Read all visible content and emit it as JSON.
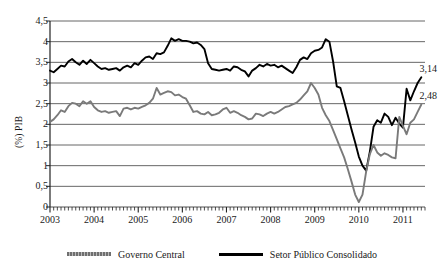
{
  "chart_data": {
    "type": "line",
    "title": "",
    "xlabel": "",
    "ylabel": "(%) PIB",
    "ylim": [
      0,
      4.5
    ],
    "xlim": [
      2003.0,
      2011.5
    ],
    "ytick_labels": [
      "4,5",
      "4",
      "3,5",
      "3",
      "2,5",
      "2",
      "1,5",
      "1",
      "0,5",
      "0"
    ],
    "ytick_values": [
      4.5,
      4,
      3.5,
      3,
      2.5,
      2,
      1.5,
      1,
      0.5,
      0
    ],
    "xtick_labels": [
      "2003",
      "2004",
      "2005",
      "2006",
      "2007",
      "2008",
      "2009",
      "2010",
      "2011"
    ],
    "xtick_values": [
      2003,
      2004,
      2005,
      2006,
      2007,
      2008,
      2009,
      2010,
      2011
    ],
    "grid": true,
    "minor_ticks": "monthly",
    "legend_position": "bottom",
    "colors": {
      "governo_central": "#7a7a7a",
      "setor_publico": "#000000",
      "grid": "#555555",
      "axis": "#222222"
    },
    "annotations": [
      {
        "text": "3,14",
        "series": "Setor Público Consolidado",
        "x": 2011.42,
        "y": 3.14
      },
      {
        "text": "2,48",
        "series": "Governo Central",
        "x": 2011.42,
        "y": 2.48
      }
    ],
    "series": [
      {
        "name": "Setor Público Consolidado",
        "color": "#000000",
        "x": [
          2003.0,
          2003.083,
          2003.167,
          2003.25,
          2003.333,
          2003.417,
          2003.5,
          2003.583,
          2003.667,
          2003.75,
          2003.833,
          2003.917,
          2004.0,
          2004.083,
          2004.167,
          2004.25,
          2004.333,
          2004.417,
          2004.5,
          2004.583,
          2004.667,
          2004.75,
          2004.833,
          2004.917,
          2005.0,
          2005.083,
          2005.167,
          2005.25,
          2005.333,
          2005.417,
          2005.5,
          2005.583,
          2005.667,
          2005.75,
          2005.833,
          2005.917,
          2006.0,
          2006.083,
          2006.167,
          2006.25,
          2006.333,
          2006.417,
          2006.5,
          2006.583,
          2006.667,
          2006.75,
          2006.833,
          2006.917,
          2007.0,
          2007.083,
          2007.167,
          2007.25,
          2007.333,
          2007.417,
          2007.5,
          2007.583,
          2007.667,
          2007.75,
          2007.833,
          2007.917,
          2008.0,
          2008.083,
          2008.167,
          2008.25,
          2008.333,
          2008.417,
          2008.5,
          2008.583,
          2008.667,
          2008.75,
          2008.833,
          2008.917,
          2009.0,
          2009.083,
          2009.167,
          2009.25,
          2009.333,
          2009.417,
          2009.5,
          2009.583,
          2009.667,
          2009.75,
          2009.833,
          2009.917,
          2010.0,
          2010.083,
          2010.167,
          2010.25,
          2010.333,
          2010.417,
          2010.5,
          2010.583,
          2010.667,
          2010.75,
          2010.833,
          2010.917,
          2011.0,
          2011.083,
          2011.167,
          2011.25,
          2011.333,
          2011.417
        ],
        "values": [
          3.3,
          3.26,
          3.34,
          3.42,
          3.4,
          3.52,
          3.58,
          3.5,
          3.44,
          3.54,
          3.46,
          3.56,
          3.48,
          3.4,
          3.34,
          3.36,
          3.32,
          3.34,
          3.36,
          3.3,
          3.38,
          3.42,
          3.38,
          3.48,
          3.44,
          3.54,
          3.62,
          3.64,
          3.58,
          3.72,
          3.7,
          3.74,
          3.9,
          4.08,
          4.02,
          4.06,
          4.02,
          4.02,
          4.0,
          3.96,
          3.98,
          3.92,
          3.82,
          3.48,
          3.34,
          3.32,
          3.3,
          3.32,
          3.34,
          3.3,
          3.4,
          3.38,
          3.32,
          3.28,
          3.16,
          3.3,
          3.36,
          3.44,
          3.4,
          3.46,
          3.42,
          3.44,
          3.38,
          3.42,
          3.36,
          3.3,
          3.24,
          3.38,
          3.56,
          3.62,
          3.58,
          3.72,
          3.78,
          3.8,
          3.86,
          4.06,
          4.0,
          3.52,
          2.92,
          2.88,
          2.56,
          2.22,
          1.88,
          1.56,
          1.22,
          1.0,
          0.88,
          1.34,
          1.94,
          2.1,
          2.04,
          2.26,
          2.18,
          1.98,
          2.16,
          2.02,
          1.92,
          2.86,
          2.58,
          2.8,
          3.0,
          3.14
        ]
      },
      {
        "name": "Governo Central",
        "color": "#7a7a7a",
        "x": [
          2003.0,
          2003.083,
          2003.167,
          2003.25,
          2003.333,
          2003.417,
          2003.5,
          2003.583,
          2003.667,
          2003.75,
          2003.833,
          2003.917,
          2004.0,
          2004.083,
          2004.167,
          2004.25,
          2004.333,
          2004.417,
          2004.5,
          2004.583,
          2004.667,
          2004.75,
          2004.833,
          2004.917,
          2005.0,
          2005.083,
          2005.167,
          2005.25,
          2005.333,
          2005.417,
          2005.5,
          2005.583,
          2005.667,
          2005.75,
          2005.833,
          2005.917,
          2006.0,
          2006.083,
          2006.167,
          2006.25,
          2006.333,
          2006.417,
          2006.5,
          2006.583,
          2006.667,
          2006.75,
          2006.833,
          2006.917,
          2007.0,
          2007.083,
          2007.167,
          2007.25,
          2007.333,
          2007.417,
          2007.5,
          2007.583,
          2007.667,
          2007.75,
          2007.833,
          2007.917,
          2008.0,
          2008.083,
          2008.167,
          2008.25,
          2008.333,
          2008.417,
          2008.5,
          2008.583,
          2008.667,
          2008.75,
          2008.833,
          2008.917,
          2009.0,
          2009.083,
          2009.167,
          2009.25,
          2009.333,
          2009.417,
          2009.5,
          2009.583,
          2009.667,
          2009.75,
          2009.833,
          2009.917,
          2010.0,
          2010.083,
          2010.167,
          2010.25,
          2010.333,
          2010.417,
          2010.5,
          2010.583,
          2010.667,
          2010.75,
          2010.833,
          2010.917,
          2011.0,
          2011.083,
          2011.167,
          2011.25,
          2011.333,
          2011.417
        ],
        "values": [
          2.06,
          2.12,
          2.22,
          2.34,
          2.3,
          2.44,
          2.52,
          2.5,
          2.44,
          2.56,
          2.5,
          2.56,
          2.42,
          2.34,
          2.3,
          2.32,
          2.28,
          2.3,
          2.32,
          2.2,
          2.38,
          2.4,
          2.36,
          2.4,
          2.38,
          2.42,
          2.46,
          2.52,
          2.62,
          2.88,
          2.72,
          2.76,
          2.8,
          2.78,
          2.7,
          2.72,
          2.66,
          2.62,
          2.46,
          2.3,
          2.32,
          2.26,
          2.24,
          2.3,
          2.22,
          2.24,
          2.28,
          2.36,
          2.4,
          2.28,
          2.32,
          2.28,
          2.22,
          2.18,
          2.12,
          2.14,
          2.26,
          2.24,
          2.2,
          2.26,
          2.3,
          2.26,
          2.3,
          2.36,
          2.42,
          2.44,
          2.48,
          2.52,
          2.6,
          2.7,
          2.8,
          3.0,
          2.88,
          2.72,
          2.4,
          2.22,
          2.08,
          1.86,
          1.64,
          1.42,
          1.2,
          0.92,
          0.62,
          0.3,
          0.12,
          0.3,
          0.86,
          1.28,
          1.5,
          1.32,
          1.24,
          1.3,
          1.26,
          1.2,
          1.18,
          2.18,
          1.96,
          1.76,
          2.04,
          2.12,
          2.3,
          2.48
        ]
      }
    ]
  },
  "legend": {
    "items": [
      {
        "label": "Governo Central",
        "style": "gray"
      },
      {
        "label": "Setor Público Consolidado",
        "style": "black"
      }
    ]
  }
}
